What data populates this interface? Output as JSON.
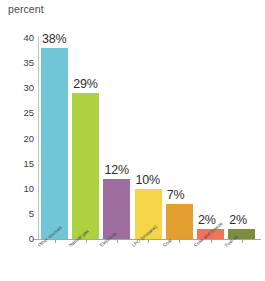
{
  "chart_data": {
    "type": "bar",
    "title": "",
    "ylabel": "percent",
    "xlabel": "",
    "ylim": [
      0,
      40
    ],
    "grid": false,
    "legend": "none",
    "y_ticks": [
      0,
      5,
      10,
      15,
      20,
      25,
      30,
      35,
      40
    ],
    "y_tick_labels": [
      "0",
      "5",
      "10",
      "15",
      "20",
      "25",
      "30",
      "35",
      "40"
    ],
    "categories": [
      "Other sources",
      "Natural gas",
      "Electricity",
      "LPG (propane)",
      "Coal",
      "Coke and breeze",
      "Fuel oil"
    ],
    "values": [
      38,
      29,
      12,
      10,
      7,
      2,
      2
    ],
    "data_labels": [
      "38%",
      "29%",
      "12%",
      "10%",
      "7%",
      "2%",
      "2%"
    ],
    "bar_colors": [
      "#70c5d6",
      "#add13f",
      "#9d6e9e",
      "#f7d548",
      "#e2a12e",
      "#f0735a",
      "#7f8c3f"
    ]
  },
  "axis": {
    "title": "percent"
  },
  "colors": {
    "axis_line": "#9aa7ac",
    "text": "#3a3a3a",
    "background": "#ffffff"
  }
}
